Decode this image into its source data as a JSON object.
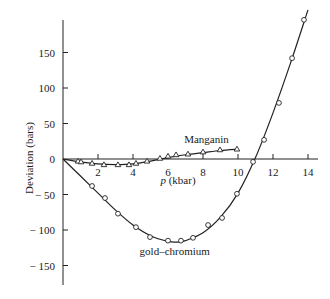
{
  "chart_data": {
    "type": "scatter",
    "title": "",
    "xlabel": "p (kbar)",
    "ylabel": "Deviation (bars)",
    "xlim": [
      0,
      14.5
    ],
    "ylim": [
      -185,
      195
    ],
    "x_ticks": [
      1,
      2,
      3,
      4,
      5,
      6,
      7,
      8,
      9,
      10,
      11,
      12,
      13,
      14
    ],
    "x_tick_labels": [
      "2",
      "4",
      "6",
      "8",
      "10",
      "12",
      "14"
    ],
    "x_tick_label_values": [
      2,
      4,
      6,
      8,
      10,
      12,
      14
    ],
    "y_ticks": [
      150,
      100,
      50,
      0,
      -50,
      -100,
      -150
    ],
    "y_tick_labels": [
      "150",
      "100",
      "50",
      "0",
      "− 50",
      "− 100",
      "− 150"
    ],
    "grid": false,
    "legend": "inline labels",
    "series": [
      {
        "name": "Manganin",
        "marker": "triangle",
        "fit": "smooth curve",
        "label_pos": [
          8.2,
          22
        ],
        "x": [
          0.86,
          1.03,
          1.66,
          2.34,
          3.14,
          3.77,
          4.17,
          4.8,
          5.54,
          6.0,
          6.46,
          7.14,
          8.0,
          8.97,
          9.94
        ],
        "values": [
          -3,
          -4,
          -6,
          -8,
          -8,
          -8,
          -6,
          -3,
          1,
          4,
          6,
          7,
          10,
          13,
          14
        ],
        "curve_x": [
          0,
          1,
          2,
          3,
          4,
          5,
          6,
          7,
          8,
          9,
          10
        ],
        "curve_y": [
          0,
          -4,
          -7,
          -8,
          -7,
          -3,
          2,
          6,
          9,
          12,
          14
        ]
      },
      {
        "name": "gold–chromium",
        "marker": "circle",
        "fit": "smooth curve",
        "label_pos": [
          4.1,
          -135
        ],
        "x": [
          1.66,
          2.4,
          3.14,
          4.17,
          4.97,
          6.0,
          6.74,
          7.43,
          8.29,
          9.09,
          9.94,
          10.86,
          11.49,
          12.34,
          13.09,
          13.77
        ],
        "values": [
          -38,
          -55,
          -77,
          -96,
          -110,
          -115,
          -115,
          -111,
          -93,
          -83,
          -49,
          -4,
          27,
          79,
          142,
          196
        ],
        "curve_x": [
          0,
          1,
          2,
          3,
          4,
          5,
          6,
          6.5,
          7,
          8,
          9,
          10,
          11,
          12,
          13,
          14
        ],
        "curve_y": [
          0,
          -24,
          -48,
          -72,
          -93,
          -108,
          -116,
          -117,
          -115,
          -104,
          -82,
          -48,
          2,
          65,
          135,
          210
        ]
      }
    ]
  },
  "layout": {
    "origin_px": [
      63,
      159
    ],
    "px_per_x": 17.5,
    "px_per_y": 0.71,
    "axis_top_px": 20,
    "axis_bottom_px": 285,
    "x_axis_right_px": 318,
    "ylabel_pos_px": [
      33,
      158
    ],
    "xlabel_pos_px": [
      178,
      184
    ]
  },
  "colors": {
    "ink": "#222222",
    "background": "#ffffff"
  }
}
